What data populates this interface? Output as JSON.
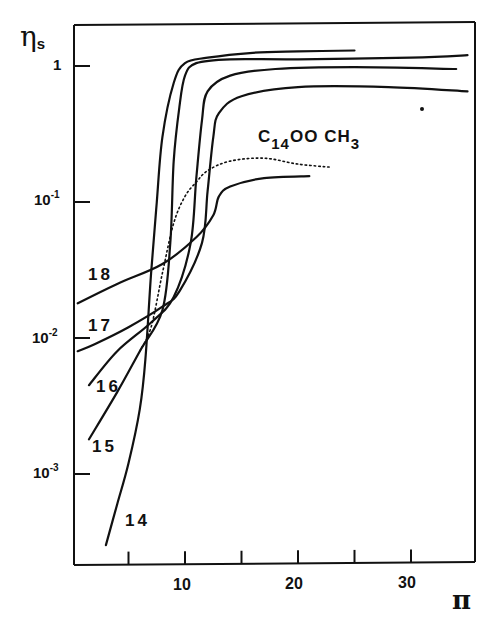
{
  "chart_data": {
    "type": "line",
    "title": "",
    "xlabel": "π",
    "ylabel": "η_s",
    "yscale": "log",
    "xlim": [
      0,
      35
    ],
    "ylim": [
      0.0002,
      2
    ],
    "grid": false,
    "x_ticks": [
      5,
      10,
      15,
      20,
      25,
      30
    ],
    "x_tick_labels": [
      "10",
      "20",
      "30"
    ],
    "y_ticks": [
      1,
      0.1,
      0.01,
      0.001
    ],
    "y_tick_labels": [
      {
        "base": "1",
        "exp": ""
      },
      {
        "base": "10",
        "exp": "-1"
      },
      {
        "base": "10",
        "exp": "-2"
      },
      {
        "base": "10",
        "exp": "-3"
      }
    ],
    "series": [
      {
        "name": "14",
        "style": "solid",
        "x": [
          3,
          4,
          5,
          6,
          6.5,
          7,
          7.5,
          8,
          9,
          10,
          12,
          16,
          20,
          25
        ],
        "y": [
          0.0003,
          0.0006,
          0.0012,
          0.003,
          0.007,
          0.03,
          0.1,
          0.3,
          0.75,
          1.05,
          1.15,
          1.25,
          1.28,
          1.3
        ]
      },
      {
        "name": "15",
        "style": "solid",
        "x": [
          1.5,
          4,
          6,
          8,
          8.7,
          9,
          9.5,
          10,
          11,
          14,
          20,
          30,
          35
        ],
        "y": [
          0.0018,
          0.004,
          0.008,
          0.016,
          0.05,
          0.2,
          0.5,
          0.85,
          1.05,
          1.12,
          1.12,
          1.15,
          1.2
        ]
      },
      {
        "name": "16",
        "style": "solid",
        "x": [
          1.5,
          4,
          7,
          9,
          10.5,
          11,
          11.5,
          12,
          14,
          18,
          25,
          34
        ],
        "y": [
          0.0045,
          0.008,
          0.013,
          0.02,
          0.05,
          0.15,
          0.4,
          0.65,
          0.85,
          0.95,
          0.98,
          0.95
        ]
      },
      {
        "name": "17",
        "style": "solid",
        "x": [
          0.5,
          2,
          5,
          8,
          9.5,
          11.5,
          12,
          12.5,
          13,
          15,
          20,
          28,
          35
        ],
        "y": [
          0.008,
          0.009,
          0.012,
          0.017,
          0.022,
          0.05,
          0.12,
          0.3,
          0.45,
          0.6,
          0.7,
          0.7,
          0.65
        ]
      },
      {
        "name": "18",
        "style": "solid",
        "x": [
          0.5,
          4,
          8,
          11,
          12.5,
          13,
          14,
          17,
          21
        ],
        "y": [
          0.018,
          0.025,
          0.035,
          0.055,
          0.08,
          0.11,
          0.13,
          0.15,
          0.155
        ]
      },
      {
        "name": "C14OOCH3",
        "style": "dotted",
        "x": [
          6,
          7,
          8,
          9,
          10,
          11,
          12,
          14,
          17,
          20,
          23
        ],
        "y": [
          0.008,
          0.012,
          0.03,
          0.07,
          0.11,
          0.14,
          0.17,
          0.2,
          0.21,
          0.19,
          0.18
        ]
      }
    ],
    "annotations": [
      {
        "text": "18",
        "near": "series 18 left end"
      },
      {
        "text": "17",
        "near": "series 17 left end"
      },
      {
        "text": "16",
        "near": "series 16 left end"
      },
      {
        "text": "15",
        "near": "series 15 left end"
      },
      {
        "text": "14",
        "near": "series 14 bottom"
      },
      {
        "text": "C14OOCH3",
        "near": "dotted curve"
      }
    ]
  },
  "labels": {
    "ylabel_main": "η",
    "ylabel_sub": "s",
    "xlabel": "π",
    "series_name_main": "C",
    "series_name_sub": "14",
    "series_name_rest": "OO CH",
    "series_name_sub2": "3",
    "curve_labels": [
      "18",
      "17",
      "16",
      "15",
      "14"
    ]
  }
}
